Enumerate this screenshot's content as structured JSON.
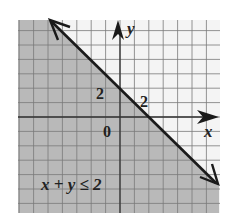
{
  "chart_data": {
    "type": "line",
    "title": "",
    "inequality_label": "x + y ≤ 2",
    "boundary_line": {
      "equation": "x + y = 2",
      "style": "solid",
      "points": [
        [
          -5,
          7
        ],
        [
          0,
          2
        ],
        [
          2,
          0
        ],
        [
          7,
          -5
        ]
      ]
    },
    "shaded_region": "below-left of line (x + y ≤ 2)",
    "xlabel": "x",
    "ylabel": "y",
    "xlim": [
      -7,
      7
    ],
    "ylim": [
      -7,
      7
    ],
    "grid": true,
    "grid_step": 1,
    "tick_labels": {
      "x_intercept_label": "2",
      "y_intercept_label": "2",
      "origin_label": "0"
    }
  },
  "colors": {
    "shade": "#b9b9b9",
    "background": "#f4f4f4",
    "grid": "#7a7a7a",
    "axis": "#333333",
    "line": "#1a1a1a"
  },
  "labels": {
    "x_axis": "x",
    "y_axis": "y",
    "y_two": "2",
    "x_two": "2",
    "origin": "0",
    "inequality": "x + y ≤ 2"
  }
}
